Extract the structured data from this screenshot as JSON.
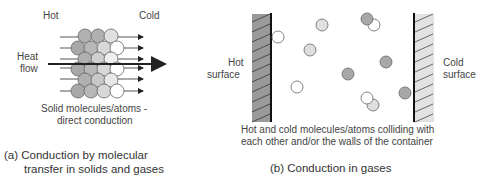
{
  "panel_a": {
    "label_hot": "Hot",
    "label_cold": "Cold",
    "label_heat": "Heat",
    "label_flow": "flow",
    "note_line1": "Solid molecules/atoms -",
    "note_line2": "direct conduction",
    "caption_line1": "(a) Conduction by molecular",
    "caption_line2": "transfer in solids and gases"
  },
  "panel_b": {
    "label_hot_1": "Hot",
    "label_hot_2": "surface",
    "label_cold_1": "Cold",
    "label_cold_2": "surface",
    "note_line1": "Hot and cold molecules/atoms colliding with",
    "note_line2": "each other and/or the walls of the container",
    "caption": "(b) Conduction in gases"
  },
  "colors": {
    "dark": "#a8a8a8",
    "mid": "#c6c6c6",
    "light": "#e4e4e4",
    "white": "#ffffff",
    "stroke": "#555555"
  }
}
